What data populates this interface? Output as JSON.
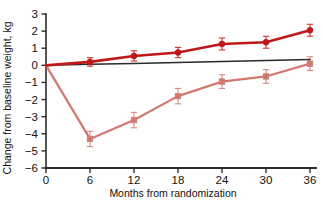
{
  "chart_data": {
    "type": "line",
    "title": "",
    "subtitle": "",
    "xlabel": "Months from randomization",
    "ylabel": "Change from baseline weight, kg",
    "x": [
      0,
      6,
      12,
      18,
      24,
      30,
      36
    ],
    "xlim": [
      0,
      36
    ],
    "ylim": [
      -6,
      3
    ],
    "xticks": [
      "0",
      "6",
      "12",
      "18",
      "24",
      "30",
      "36"
    ],
    "yticks": [
      "3",
      "2",
      "1",
      "0",
      "-1",
      "-2",
      "-3",
      "-4",
      "-5",
      "-6"
    ],
    "ytick_values": [
      3,
      2,
      1,
      0,
      -1,
      -2,
      -3,
      -4,
      -5,
      -6
    ],
    "grid": false,
    "legend": "none",
    "series": [
      {
        "name": "dark-red-circles",
        "color": "#C01818",
        "marker": "circle",
        "values": [
          0,
          0.2,
          0.55,
          0.75,
          1.25,
          1.35,
          2.05
        ],
        "err_low": [
          0,
          0.25,
          0.3,
          0.3,
          0.35,
          0.35,
          0.35
        ],
        "err_high": [
          0,
          0.25,
          0.3,
          0.3,
          0.35,
          0.35,
          0.35
        ]
      },
      {
        "name": "light-red-squares",
        "color": "#D1786F",
        "marker": "square",
        "values": [
          0,
          -4.3,
          -3.2,
          -1.8,
          -0.95,
          -0.65,
          0.1
        ],
        "err_low": [
          0,
          0.45,
          0.45,
          0.45,
          0.4,
          0.4,
          0.4
        ],
        "err_high": [
          0,
          0.45,
          0.45,
          0.45,
          0.4,
          0.4,
          0.4
        ]
      },
      {
        "name": "black-reference-line",
        "color": "#2b2b2b",
        "marker": "none",
        "values": [
          0,
          0.06,
          0.11,
          0.17,
          0.23,
          0.28,
          0.34
        ],
        "err_low": [
          0,
          0,
          0,
          0,
          0,
          0,
          0
        ],
        "err_high": [
          0,
          0,
          0,
          0,
          0,
          0,
          0
        ]
      }
    ]
  },
  "colors": {
    "dark_red": "#C01818",
    "light_red": "#D1786F",
    "axis": "#2b2b2b",
    "background": "#ffffff"
  }
}
